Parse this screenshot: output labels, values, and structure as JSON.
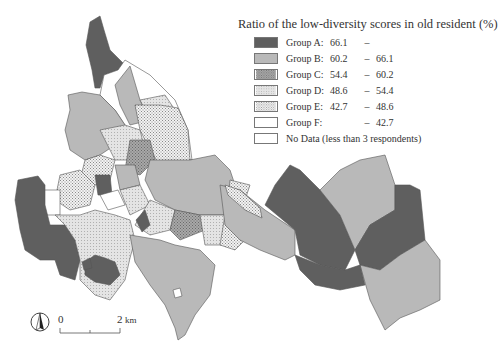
{
  "legend": {
    "title": "Ratio of the low-diversity scores in old resident (%)",
    "groups": [
      {
        "label": "Group A:",
        "low": "66.1",
        "dash": "–",
        "high": "",
        "fill": "#5f5f5f",
        "pattern": "solid"
      },
      {
        "label": "Group B:",
        "low": "60.2",
        "dash": "–",
        "high": "66.1",
        "fill": "#b9b9b9",
        "pattern": "solid"
      },
      {
        "label": "Group C:",
        "low": "54.4",
        "dash": "–",
        "high": "60.2",
        "fill": "#9a9a9a",
        "pattern": "dense-dots"
      },
      {
        "label": "Group D:",
        "low": "48.6",
        "dash": "–",
        "high": "54.4",
        "fill": "#dcdcdc",
        "pattern": "light-dots"
      },
      {
        "label": "Group E:",
        "low": "42.7",
        "dash": "–",
        "high": "48.6",
        "fill": "#e8e8e8",
        "pattern": "crosshatch"
      },
      {
        "label": "Group F:",
        "low": "",
        "dash": "–",
        "high": "42.7",
        "fill": "#ffffff",
        "pattern": "solid"
      }
    ],
    "no_data": {
      "label": "No Data (less than 3 respondents)",
      "fill": "#ffffff"
    }
  },
  "scale_bar": {
    "start": "0",
    "end": "2",
    "unit": "km"
  },
  "north_arrow": {
    "icon": "north-arrow-icon"
  },
  "colors": {
    "group_a": "#5f5f5f",
    "group_b": "#b9b9b9",
    "border": "#444444"
  }
}
